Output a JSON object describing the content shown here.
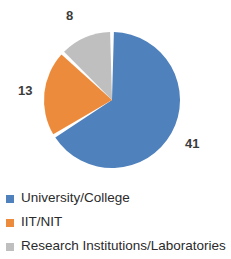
{
  "chart_data": {
    "type": "pie",
    "title": "",
    "subtitle": "",
    "xlabel": "",
    "ylabel": "",
    "grid": false,
    "legend_position": "bottom-left",
    "total": 62,
    "start_angle_deg": 0,
    "direction": "clockwise",
    "categories": [
      "University/College",
      "IIT/NIT",
      "Research Institutions/Laboratories"
    ],
    "values": [
      41,
      13,
      8
    ],
    "slices": [
      {
        "label": "University/College",
        "value": 41,
        "value_text": "41",
        "color": "#4F81BD",
        "sweep_deg": 238.1,
        "start_deg": 0
      },
      {
        "label": "IIT/NIT",
        "value": 13,
        "value_text": "13",
        "color": "#ED8B3C",
        "sweep_deg": 75.5,
        "start_deg": 238.1
      },
      {
        "label": "Research Institutions/Laboratories",
        "value": 8,
        "value_text": "8",
        "color": "#BFBFBF",
        "sweep_deg": 46.4,
        "start_deg": 313.6
      }
    ]
  },
  "data_labels": {
    "blue": "41",
    "orange": "13",
    "gray": "8"
  },
  "legend": {
    "items": [
      {
        "label": "University/College",
        "color": "#4F81BD",
        "swatch_name": "legend-swatch-university-college"
      },
      {
        "label": "IIT/NIT",
        "color": "#ED8B3C",
        "swatch_name": "legend-swatch-iit-nit"
      },
      {
        "label": "Research Institutions/Laboratories",
        "color": "#BFBFBF",
        "swatch_name": "legend-swatch-research-institutions"
      }
    ]
  },
  "colors": {
    "series_blue": "#4F81BD",
    "series_orange": "#ED8B3C",
    "series_gray": "#BFBFBF",
    "label_text": "#3b3b3b",
    "legend_text": "#2b2b2b",
    "background": "#ffffff",
    "slice_border": "#ffffff"
  }
}
